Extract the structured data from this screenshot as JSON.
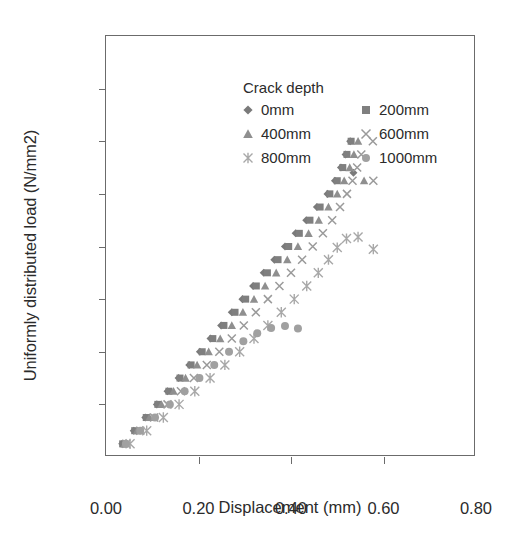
{
  "chart": {
    "type": "scatter",
    "title": "",
    "xlabel": "Displacement (mm)",
    "ylabel": "Uniformly distributed load (N/mm2)",
    "legend_title": "Crack depth",
    "legend_position": "upper-left-inside",
    "grid": false,
    "xlim": [
      0.0,
      0.8
    ],
    "ylim": [
      0.0,
      0.08
    ],
    "xticks": [
      "0.00",
      "0.20",
      "0.40",
      "0.60",
      "0.80"
    ],
    "xtick_values": [
      0.0,
      0.2,
      0.4,
      0.6,
      0.8
    ],
    "yticks": [
      "0.00",
      "0.01",
      "0.02",
      "0.03",
      "0.04",
      "0.05",
      "0.06",
      "0.07",
      "0.08"
    ],
    "ytick_values": [
      0.0,
      0.01,
      0.02,
      0.03,
      0.04,
      0.05,
      0.06,
      0.07,
      0.08
    ]
  },
  "chart_data": {
    "type": "scatter",
    "title": "",
    "xlabel": "Displacement (mm)",
    "ylabel": "Uniformly distributed load (N/mm2)",
    "xlim": [
      0.0,
      0.8
    ],
    "ylim": [
      0.0,
      0.08
    ],
    "grid": false,
    "legend": "Crack depth",
    "series": [
      {
        "name": "0mm",
        "label": "0mm",
        "marker": "diamond",
        "color": "#7a7a7a",
        "size": 7,
        "points": [
          [
            0.035,
            0.0025
          ],
          [
            0.06,
            0.005
          ],
          [
            0.085,
            0.0075
          ],
          [
            0.11,
            0.01
          ],
          [
            0.133,
            0.0125
          ],
          [
            0.157,
            0.015
          ],
          [
            0.18,
            0.0175
          ],
          [
            0.203,
            0.02
          ],
          [
            0.226,
            0.0225
          ],
          [
            0.249,
            0.025
          ],
          [
            0.272,
            0.0275
          ],
          [
            0.295,
            0.03
          ],
          [
            0.318,
            0.0325
          ],
          [
            0.341,
            0.035
          ],
          [
            0.364,
            0.0375
          ],
          [
            0.387,
            0.04
          ],
          [
            0.41,
            0.0425
          ],
          [
            0.433,
            0.045
          ],
          [
            0.456,
            0.0475
          ],
          [
            0.479,
            0.05
          ],
          [
            0.495,
            0.0525
          ],
          [
            0.508,
            0.055
          ],
          [
            0.518,
            0.0575
          ],
          [
            0.528,
            0.06
          ],
          [
            0.535,
            0.054
          ]
        ]
      },
      {
        "name": "200mm",
        "label": "200mm",
        "marker": "square",
        "color": "#7f7f7f",
        "size": 7,
        "points": [
          [
            0.036,
            0.0025
          ],
          [
            0.062,
            0.005
          ],
          [
            0.087,
            0.0075
          ],
          [
            0.112,
            0.01
          ],
          [
            0.136,
            0.0125
          ],
          [
            0.16,
            0.015
          ],
          [
            0.184,
            0.0175
          ],
          [
            0.208,
            0.02
          ],
          [
            0.231,
            0.0225
          ],
          [
            0.255,
            0.025
          ],
          [
            0.279,
            0.0275
          ],
          [
            0.302,
            0.03
          ],
          [
            0.325,
            0.0325
          ],
          [
            0.349,
            0.035
          ],
          [
            0.372,
            0.0375
          ],
          [
            0.395,
            0.04
          ],
          [
            0.418,
            0.0425
          ],
          [
            0.441,
            0.045
          ],
          [
            0.463,
            0.0475
          ],
          [
            0.484,
            0.05
          ],
          [
            0.5,
            0.0525
          ],
          [
            0.512,
            0.055
          ],
          [
            0.521,
            0.0575
          ],
          [
            0.53,
            0.06
          ]
        ]
      },
      {
        "name": "400mm",
        "label": "400mm",
        "marker": "triangle",
        "color": "#8f8f8f",
        "size": 7,
        "points": [
          [
            0.04,
            0.0025
          ],
          [
            0.067,
            0.005
          ],
          [
            0.094,
            0.0075
          ],
          [
            0.12,
            0.01
          ],
          [
            0.146,
            0.0125
          ],
          [
            0.172,
            0.015
          ],
          [
            0.197,
            0.0175
          ],
          [
            0.222,
            0.02
          ],
          [
            0.247,
            0.0225
          ],
          [
            0.272,
            0.025
          ],
          [
            0.296,
            0.0275
          ],
          [
            0.32,
            0.03
          ],
          [
            0.344,
            0.0325
          ],
          [
            0.368,
            0.035
          ],
          [
            0.392,
            0.0375
          ],
          [
            0.415,
            0.04
          ],
          [
            0.438,
            0.0425
          ],
          [
            0.46,
            0.045
          ],
          [
            0.481,
            0.0475
          ],
          [
            0.5,
            0.05
          ],
          [
            0.515,
            0.0525
          ],
          [
            0.527,
            0.055
          ],
          [
            0.536,
            0.0575
          ],
          [
            0.545,
            0.06
          ],
          [
            0.558,
            0.0525
          ]
        ]
      },
      {
        "name": "600mm",
        "label": "600mm",
        "marker": "cross",
        "color": "#9a9a9a",
        "size": 8,
        "points": [
          [
            0.044,
            0.0025
          ],
          [
            0.074,
            0.005
          ],
          [
            0.104,
            0.0075
          ],
          [
            0.133,
            0.01
          ],
          [
            0.162,
            0.0125
          ],
          [
            0.19,
            0.015
          ],
          [
            0.218,
            0.0175
          ],
          [
            0.245,
            0.02
          ],
          [
            0.272,
            0.0225
          ],
          [
            0.298,
            0.025
          ],
          [
            0.324,
            0.0275
          ],
          [
            0.35,
            0.03
          ],
          [
            0.375,
            0.0325
          ],
          [
            0.4,
            0.035
          ],
          [
            0.424,
            0.0375
          ],
          [
            0.447,
            0.04
          ],
          [
            0.469,
            0.0425
          ],
          [
            0.489,
            0.045
          ],
          [
            0.506,
            0.0475
          ],
          [
            0.521,
            0.05
          ],
          [
            0.533,
            0.0525
          ],
          [
            0.543,
            0.055
          ],
          [
            0.552,
            0.0575
          ],
          [
            0.577,
            0.06
          ],
          [
            0.578,
            0.0525
          ]
        ]
      },
      {
        "name": "800mm",
        "label": "800mm",
        "marker": "star",
        "color": "#a8a8a8",
        "size": 9,
        "points": [
          [
            0.052,
            0.0025
          ],
          [
            0.088,
            0.005
          ],
          [
            0.124,
            0.0075
          ],
          [
            0.158,
            0.01
          ],
          [
            0.192,
            0.0125
          ],
          [
            0.225,
            0.015
          ],
          [
            0.257,
            0.0175
          ],
          [
            0.289,
            0.02
          ],
          [
            0.32,
            0.0225
          ],
          [
            0.35,
            0.025
          ],
          [
            0.379,
            0.0275
          ],
          [
            0.407,
            0.03
          ],
          [
            0.434,
            0.0325
          ],
          [
            0.459,
            0.035
          ],
          [
            0.481,
            0.0375
          ],
          [
            0.5,
            0.0398
          ],
          [
            0.52,
            0.0415
          ],
          [
            0.545,
            0.0418
          ],
          [
            0.578,
            0.0395
          ]
        ]
      },
      {
        "name": "1000mm",
        "label": "1000mm",
        "marker": "circle",
        "color": "#a0a0a0",
        "size": 8,
        "points": [
          [
            0.043,
            0.0025
          ],
          [
            0.074,
            0.005
          ],
          [
            0.106,
            0.0075
          ],
          [
            0.138,
            0.01
          ],
          [
            0.17,
            0.0125
          ],
          [
            0.202,
            0.015
          ],
          [
            0.234,
            0.0175
          ],
          [
            0.266,
            0.02
          ],
          [
            0.297,
            0.022
          ],
          [
            0.327,
            0.0235
          ],
          [
            0.357,
            0.0245
          ],
          [
            0.387,
            0.0249
          ],
          [
            0.415,
            0.0244
          ]
        ]
      }
    ]
  },
  "legend_items": [
    {
      "label": "0mm",
      "marker": "diamond",
      "color": "#7a7a7a"
    },
    {
      "label": "200mm",
      "marker": "square",
      "color": "#7f7f7f"
    },
    {
      "label": "400mm",
      "marker": "triangle",
      "color": "#8f8f8f"
    },
    {
      "label": "600mm",
      "marker": "cross",
      "color": "#9a9a9a"
    },
    {
      "label": "800mm",
      "marker": "star",
      "color": "#a8a8a8"
    },
    {
      "label": "1000mm",
      "marker": "circle",
      "color": "#a0a0a0"
    }
  ]
}
